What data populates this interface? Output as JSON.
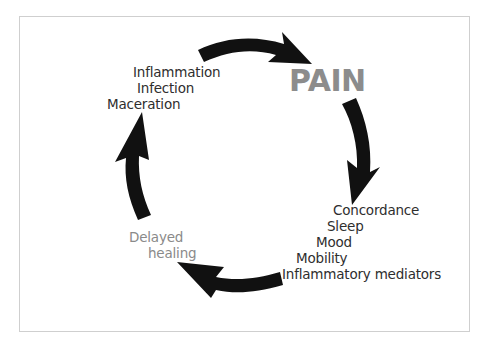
{
  "diagram": {
    "type": "cycle",
    "center_label": "PAIN",
    "colors": {
      "arrows": "#111111",
      "pain_text": "#8c8c8c",
      "factor_text": "#2e2e2e",
      "delayed_healing_text": "#8a8a8a",
      "frame_border": "#cfcfcf"
    },
    "groups": {
      "top_left": [
        "Inflammation",
        "Infection",
        "Maceration"
      ],
      "bottom_right": [
        "Concordance",
        "Sleep",
        "Mood",
        "Mobility",
        "Inflammatory mediators"
      ],
      "bottom_left": [
        "Delayed",
        "healing"
      ]
    },
    "arrows": [
      {
        "from": "top_left",
        "to": "PAIN",
        "direction": "clockwise"
      },
      {
        "from": "PAIN",
        "to": "bottom_right",
        "direction": "clockwise"
      },
      {
        "from": "bottom_right",
        "to": "bottom_left",
        "direction": "clockwise"
      },
      {
        "from": "bottom_left",
        "to": "top_left",
        "direction": "clockwise"
      }
    ]
  }
}
